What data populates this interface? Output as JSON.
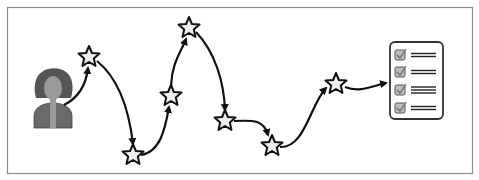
{
  "diagram": {
    "frame": {
      "x": 7,
      "y": 7,
      "width": 465,
      "height": 166,
      "stroke": "#8a8a8a"
    },
    "colors": {
      "star_fill": "#eeeeee",
      "star_stroke": "#111111",
      "arrow": "#111111",
      "person_hair": "#555555",
      "person_face": "#9a9a9a",
      "person_body": "#6a6a6a",
      "checklist_stroke": "#333333",
      "checkbox_fill": "#bdbdbd"
    },
    "person": {
      "label": "person-icon",
      "x": 55,
      "y": 98
    },
    "milestones": [
      {
        "id": "star-1",
        "x": 89,
        "y": 57
      },
      {
        "id": "star-2",
        "x": 133,
        "y": 155
      },
      {
        "id": "star-3",
        "x": 171,
        "y": 96
      },
      {
        "id": "star-4",
        "x": 189,
        "y": 28
      },
      {
        "id": "star-5",
        "x": 225,
        "y": 121
      },
      {
        "id": "star-6",
        "x": 272,
        "y": 146
      },
      {
        "id": "star-7",
        "x": 336,
        "y": 84
      }
    ],
    "checklist": {
      "label": "checklist-icon",
      "x": 390,
      "y": 42,
      "width": 53,
      "height": 77,
      "items": [
        {
          "checked": true,
          "lines": 2
        },
        {
          "checked": true,
          "lines": 2
        },
        {
          "checked": true,
          "lines": 3
        },
        {
          "checked": true,
          "lines": 2
        }
      ]
    }
  }
}
